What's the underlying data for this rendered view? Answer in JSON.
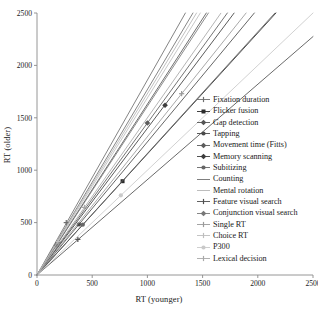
{
  "chart_data": {
    "type": "scatter",
    "title": "",
    "xlabel": "RT (younger)",
    "ylabel": "RT (older)",
    "xlim": [
      0,
      2500
    ],
    "ylim": [
      0,
      2500
    ],
    "xticks": [
      0,
      500,
      1000,
      1500,
      2000,
      2500
    ],
    "yticks": [
      0,
      500,
      1000,
      1500,
      2000,
      2500
    ],
    "grid": false,
    "legend_position": "right-inside",
    "series": [
      {
        "name": "Fixation duration",
        "color": "#6e6e6e",
        "marker": "plus",
        "slope": 1.86,
        "intercept": 0,
        "points": [
          [
            265,
            500
          ]
        ],
        "line_x": [
          0,
          1345
        ]
      },
      {
        "name": "Flicker fusion",
        "color": "#2b2b2b",
        "marker": "square",
        "slope": 1.155,
        "intercept": 0,
        "points": [
          [
            775,
            895
          ]
        ],
        "line_x": [
          0,
          2165
        ]
      },
      {
        "name": "Gap detection",
        "color": "#555555",
        "marker": "diamond",
        "slope": 1.63,
        "intercept": 0,
        "points": [
          [
            190,
            310
          ]
        ],
        "line_x": [
          0,
          1535
        ]
      },
      {
        "name": "Tapping",
        "color": "#4a4a4a",
        "marker": "circle",
        "slope": 1.27,
        "intercept": 0,
        "points": [
          [
            380,
            483
          ]
        ],
        "line_x": [
          0,
          1970
        ]
      },
      {
        "name": "Movement time (Fitts)",
        "color": "#5c5c5c",
        "marker": "diamond",
        "slope": 1.45,
        "intercept": 0,
        "points": [
          [
            1000,
            1450
          ]
        ],
        "line_x": [
          0,
          1725
        ]
      },
      {
        "name": "Memory scanning",
        "color": "#3d3d3d",
        "marker": "diamond",
        "slope": 1.4,
        "intercept": 0,
        "points": [
          [
            1160,
            1620
          ]
        ],
        "line_x": [
          0,
          1785
        ]
      },
      {
        "name": "Subitizing",
        "color": "#666666",
        "marker": "circle",
        "slope": 1.16,
        "intercept": 0,
        "points": [
          [
            415,
            480
          ]
        ],
        "line_x": [
          0,
          2155
        ]
      },
      {
        "name": "Counting",
        "color": "#707070",
        "marker": "none",
        "slope": 1.77,
        "intercept": 0,
        "points": [],
        "line_x": [
          0,
          1415
        ]
      },
      {
        "name": "Mental rotation",
        "color": "#b5b5b5",
        "marker": "none",
        "slope": 1.73,
        "intercept": 0,
        "points": [],
        "line_x": [
          0,
          1445
        ]
      },
      {
        "name": "Feature visual search",
        "color": "#4f4f4f",
        "marker": "plus",
        "slope": 0.91,
        "intercept": 0,
        "points": [
          [
            370,
            340
          ]
        ],
        "line_x": [
          0,
          2500
        ]
      },
      {
        "name": "Conjunction visual search",
        "color": "#787878",
        "marker": "diamond",
        "slope": 1.61,
        "intercept": 0,
        "points": [
          [
            175,
            283
          ]
        ],
        "line_x": [
          0,
          1555
        ]
      },
      {
        "name": "Single RT",
        "color": "#9a9a9a",
        "marker": "plus",
        "slope": 1.32,
        "intercept": 0,
        "points": [
          [
            1310,
            1730
          ]
        ],
        "line_x": [
          0,
          1895
        ]
      },
      {
        "name": "Choice RT",
        "color": "#bdbdbd",
        "marker": "plus",
        "slope": 1.69,
        "intercept": 0,
        "points": [
          [
            190,
            320
          ]
        ],
        "line_x": [
          0,
          1480
        ]
      },
      {
        "name": "P300",
        "color": "#c9c9c9",
        "marker": "circle",
        "slope": 1.0,
        "intercept": 0,
        "points": [
          [
            760,
            760
          ]
        ],
        "line_x": [
          0,
          2500
        ]
      },
      {
        "name": "Lexical decision",
        "color": "#a8a8a8",
        "marker": "plus",
        "slope": 1.5,
        "intercept": 0,
        "points": [
          [
            430,
            645
          ]
        ],
        "line_x": [
          0,
          1665
        ]
      }
    ]
  },
  "axes": {
    "xlabel": "RT (younger)",
    "ylabel": "RT (older)",
    "xticks": [
      "0",
      "500",
      "1000",
      "1500",
      "2000",
      "2500"
    ],
    "yticks": [
      "0",
      "500",
      "1000",
      "1500",
      "2000",
      "2500"
    ]
  },
  "legend": {
    "items": [
      {
        "label": "Fixation duration"
      },
      {
        "label": "Flicker fusion"
      },
      {
        "label": "Gap detection"
      },
      {
        "label": "Tapping"
      },
      {
        "label": "Movement time (Fitts)"
      },
      {
        "label": "Memory scanning"
      },
      {
        "label": "Subitizing"
      },
      {
        "label": "Counting"
      },
      {
        "label": "Mental rotation"
      },
      {
        "label": "Feature visual search"
      },
      {
        "label": "Conjunction visual search"
      },
      {
        "label": "Single RT"
      },
      {
        "label": "Choice RT"
      },
      {
        "label": "P300"
      },
      {
        "label": "Lexical decision"
      }
    ]
  },
  "colors": {
    "axis": "#8a8a8a",
    "text": "#1a1a1a",
    "background": "#ffffff"
  }
}
